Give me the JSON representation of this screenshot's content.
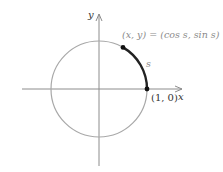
{
  "diagram": {
    "type": "unit-circle",
    "axes": {
      "x_label": "x",
      "y_label": "y",
      "color": "#8c8c8c"
    },
    "circle": {
      "color": "#9a9a9a",
      "center": [
        99,
        89
      ],
      "radius": 48
    },
    "arc": {
      "label": "s",
      "color": "#222222",
      "start_angle_deg": 0,
      "end_angle_deg": 60
    },
    "points": [
      {
        "id": "start",
        "label": "(1, 0)",
        "coords": [
          1,
          0
        ]
      },
      {
        "id": "terminal",
        "label": "(x, y) = (cos s, sin s)"
      }
    ]
  }
}
